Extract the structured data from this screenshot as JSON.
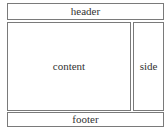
{
  "diagram": {
    "type": "page-layout-wireframe",
    "regions": {
      "header": {
        "label": "header"
      },
      "content": {
        "label": "content"
      },
      "side": {
        "label": "side"
      },
      "footer": {
        "label": "footer"
      }
    },
    "colors": {
      "border": "#7a7a7a",
      "text": "#333333",
      "background": "#ffffff"
    }
  }
}
